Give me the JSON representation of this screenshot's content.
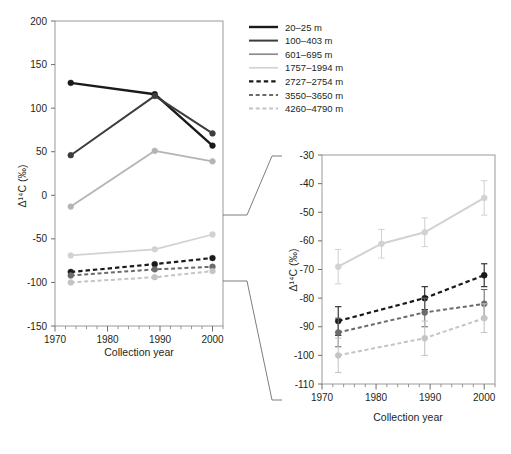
{
  "figure": {
    "main_panel": {
      "xlabel": "Collection year",
      "ylabel": "Δ¹⁴C (‰)",
      "ylim": [
        -150,
        200
      ],
      "yticks": [
        200,
        150,
        100,
        50,
        0,
        -50,
        -100,
        -150
      ],
      "xlim": [
        1970,
        2002
      ],
      "xticks": [
        1970,
        1980,
        1990,
        2000
      ],
      "grid": false
    },
    "inset_panel": {
      "xlabel": "Collection year",
      "ylabel": "Δ¹⁴C (‰)",
      "ylim": [
        -110,
        -30
      ],
      "yticks": [
        -30,
        -40,
        -50,
        -60,
        -70,
        -80,
        -90,
        -100,
        -110
      ],
      "xlim": [
        1970,
        2002
      ],
      "xticks": [
        1970,
        1980,
        1990,
        2000
      ],
      "grid": false
    },
    "legend": {
      "position": "top-right",
      "entries": [
        {
          "label": "20–25 m",
          "color": "#1a1a1a",
          "dash": "solid",
          "width": 2.4
        },
        {
          "label": "100–403 m",
          "color": "#3d3d3d",
          "dash": "solid",
          "width": 2.0
        },
        {
          "label": "601–695 m",
          "color": "#8c8c8c",
          "dash": "solid",
          "width": 1.7
        },
        {
          "label": "1757–1994 m",
          "color": "#d2d2d2",
          "dash": "solid",
          "width": 1.7
        },
        {
          "label": "2727–2754 m",
          "color": "#1a1a1a",
          "dash": "dashed",
          "width": 2.2
        },
        {
          "label": "3550–3650 m",
          "color": "#6b6b6b",
          "dash": "dashed",
          "width": 2.0
        },
        {
          "label": "4260–4790 m",
          "color": "#c4c4c4",
          "dash": "dashed",
          "width": 2.0
        }
      ]
    }
  },
  "chart_data": [
    {
      "type": "line",
      "id": "main",
      "title": "",
      "xlabel": "Collection year",
      "ylabel": "Δ¹⁴C (‰)",
      "xlim": [
        1970,
        2002
      ],
      "ylim": [
        -150,
        200
      ],
      "x": [
        1973,
        1989,
        2000
      ],
      "grid": false,
      "legend": "top-right",
      "series": [
        {
          "name": "20–25 m",
          "values": [
            129,
            116,
            57
          ],
          "color": "#1a1a1a",
          "dash": "solid",
          "width": 2.4,
          "marker": "circle"
        },
        {
          "name": "100–403 m",
          "values": [
            46,
            114,
            71
          ],
          "color": "#3d3d3d",
          "dash": "solid",
          "width": 2.0,
          "marker": "circle"
        },
        {
          "name": "601–695 m",
          "values": [
            -13,
            51,
            39
          ],
          "color": "#b4b4b4",
          "dash": "solid",
          "width": 1.8,
          "marker": "circle"
        },
        {
          "name": "1757–1994 m",
          "values": [
            -69,
            -62,
            -45
          ],
          "color": "#d2d2d2",
          "dash": "solid",
          "width": 1.8,
          "marker": "circle"
        },
        {
          "name": "2727–2754 m",
          "values": [
            -88,
            -79,
            -72
          ],
          "color": "#1a1a1a",
          "dash": "dashed",
          "width": 2.2,
          "marker": "circle"
        },
        {
          "name": "3550–3650 m",
          "values": [
            -92,
            -85,
            -82
          ],
          "color": "#6b6b6b",
          "dash": "dashed",
          "width": 2.0,
          "marker": "circle"
        },
        {
          "name": "4260–4790 m",
          "values": [
            -100,
            -94,
            -87
          ],
          "color": "#c4c4c4",
          "dash": "dashed",
          "width": 2.0,
          "marker": "circle"
        }
      ]
    },
    {
      "type": "line",
      "id": "inset",
      "title": "",
      "xlabel": "Collection year",
      "ylabel": "Δ¹⁴C (‰)",
      "xlim": [
        1970,
        2002
      ],
      "ylim": [
        -110,
        -30
      ],
      "x": [
        1973,
        1981,
        1989,
        2000
      ],
      "grid": false,
      "errorbars": true,
      "series": [
        {
          "name": "1757–1994 m",
          "values": [
            -69,
            -61,
            -57,
            -45
          ],
          "err": [
            6,
            5,
            5,
            6
          ],
          "color": "#d2d2d2",
          "dash": "solid",
          "width": 2.0,
          "marker": "circle"
        },
        {
          "name": "2727–2754 m",
          "values": [
            -88,
            null,
            -80,
            -72
          ],
          "err": [
            5,
            null,
            4,
            4
          ],
          "color": "#1a1a1a",
          "dash": "dashed",
          "width": 2.2,
          "marker": "circle"
        },
        {
          "name": "3550–3650 m",
          "values": [
            -92,
            null,
            -85,
            -82
          ],
          "err": [
            5,
            null,
            5,
            5
          ],
          "color": "#6b6b6b",
          "dash": "dashed",
          "width": 2.0,
          "marker": "circle"
        },
        {
          "name": "4260–4790 m",
          "values": [
            -100,
            null,
            -94,
            -87
          ],
          "err": [
            6,
            null,
            6,
            5
          ],
          "color": "#c4c4c4",
          "dash": "dashed",
          "width": 2.0,
          "marker": "circle"
        }
      ]
    }
  ]
}
